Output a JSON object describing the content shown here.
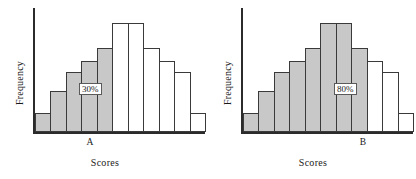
{
  "figure": {
    "panel_count": 2,
    "background_color": "#ffffff",
    "shaded_bar_color": "#c8c8c8",
    "unshaded_bar_color": "#ffffff",
    "bar_outline_color": "#3a3a3a",
    "axis_color": "#2b2b2b"
  },
  "panels": [
    {
      "id": "panel-a",
      "ylabel": "Frequency",
      "xlabel": "Scores",
      "tick_label": "A",
      "annotation": "30%"
    },
    {
      "id": "panel-b",
      "ylabel": "Frequency",
      "xlabel": "Scores",
      "tick_label": "B",
      "annotation": "80%"
    }
  ],
  "chart_data": [
    {
      "type": "bar",
      "title": "",
      "xlabel": "Scores",
      "ylabel": "Frequency",
      "grid": false,
      "legend": false,
      "categories": [
        "1",
        "2",
        "3",
        "4",
        "5",
        "6",
        "7",
        "8",
        "9",
        "10",
        "11"
      ],
      "values": [
        19,
        41,
        60,
        72,
        85,
        110,
        110,
        85,
        72,
        60,
        41,
        19
      ],
      "bar_count": 11,
      "bar_heights": [
        19,
        41,
        60,
        72,
        85,
        110,
        110,
        85,
        72,
        60,
        19
      ],
      "ylim": [
        0,
        125
      ],
      "shaded_bars": [
        0,
        1,
        2,
        3,
        4
      ],
      "shaded_fraction_label": "30%",
      "boundary_tick_label": "A",
      "boundary_bar_index": 5,
      "annotation": {
        "text": "30%",
        "bar_index": 3
      }
    },
    {
      "type": "bar",
      "title": "",
      "xlabel": "Scores",
      "ylabel": "Frequency",
      "grid": false,
      "legend": false,
      "categories": [
        "1",
        "2",
        "3",
        "4",
        "5",
        "6",
        "7",
        "8",
        "9",
        "10",
        "11"
      ],
      "values": [
        19,
        41,
        60,
        72,
        85,
        110,
        110,
        85,
        72,
        60,
        19
      ],
      "bar_count": 11,
      "bar_heights": [
        19,
        41,
        60,
        72,
        85,
        110,
        110,
        85,
        72,
        60,
        19
      ],
      "ylim": [
        0,
        125
      ],
      "shaded_bars": [
        0,
        1,
        2,
        3,
        4,
        5,
        6,
        7
      ],
      "shaded_fraction_label": "80%",
      "boundary_tick_label": "B",
      "boundary_bar_index": 8,
      "annotation": {
        "text": "80%",
        "bar_index": 6
      }
    }
  ]
}
